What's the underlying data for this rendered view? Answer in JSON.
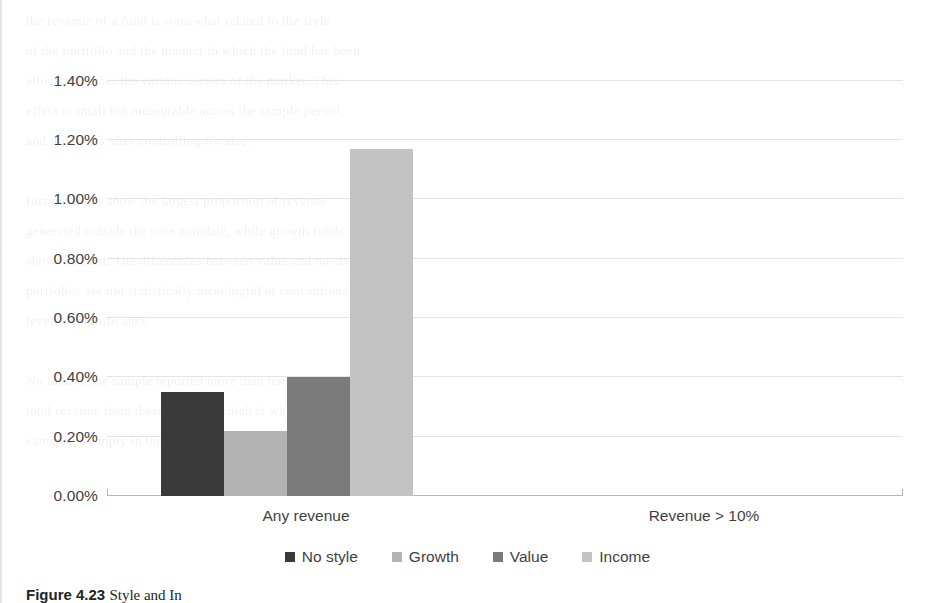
{
  "caption": {
    "figure_label": "Figure 4.23",
    "text": "Style and In"
  },
  "chart_data": {
    "type": "bar",
    "title": "",
    "xlabel": "",
    "ylabel": "",
    "categories": [
      "Any revenue",
      "Revenue > 10%"
    ],
    "series": [
      {
        "name": "No style",
        "color": "#3a3a3a",
        "values": [
          0.35,
          0.0
        ]
      },
      {
        "name": "Growth",
        "color": "#b3b3b3",
        "values": [
          0.22,
          0.0
        ]
      },
      {
        "name": "Value",
        "color": "#7b7b7b",
        "values": [
          0.4,
          0.0
        ]
      },
      {
        "name": "Income",
        "color": "#c3c3c3",
        "values": [
          1.17,
          0.0
        ]
      }
    ],
    "ylim": [
      0,
      1.5
    ],
    "ytick_values": [
      0.0,
      0.2,
      0.4,
      0.6,
      0.8,
      1.0,
      1.2,
      1.4
    ],
    "ytick_labels": [
      "0.00%",
      "0.20%",
      "0.40%",
      "0.60%",
      "0.80%",
      "1.00%",
      "1.20%",
      "1.40%"
    ],
    "unit": "%",
    "grid": true,
    "legend_position": "bottom",
    "gridline_color": "#e4e4e4",
    "axis_color": "#b6b6b6"
  },
  "page_bleed": [
    "the revenue of a fund is somewhat related to the style",
    "of the portfolio and the manner in which the fund has been",
    "allocated across the various sectors of the market. This",
    "effect is small but measurable across the sample period,",
    "and it persists after controlling for size.",
    "",
    "Income funds show the largest proportion of revenue",
    "generated outside the core mandate, while growth funds",
    "show the least. The differences between value and no-style",
    "portfolios are not statistically meaningful at conventional",
    "levels of significance.",
    "",
    "No fund in the sample reported more than ten percent of",
    "total revenue from these sources, which is why the second",
    "category is empty in the figure below."
  ]
}
